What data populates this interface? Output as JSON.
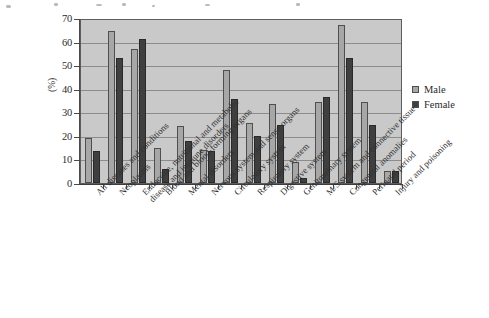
{
  "chart_data": {
    "type": "bar",
    "title": "",
    "xlabel": "",
    "ylabel": "(%)",
    "ylim": [
      0,
      70
    ],
    "yticks": [
      0,
      10,
      20,
      30,
      40,
      50,
      60,
      70
    ],
    "grid": true,
    "legend_position": "right",
    "categories": [
      "All diseases and conditions",
      "Neoplasms",
      "Endocrine, nutritional and metabolic disease and immune disorders",
      "Blood and blood-forming organs",
      "Mental disorders",
      "Nervous system and sense organs",
      "Circulatory system",
      "Respiratory system",
      "Digestive system",
      "Genitourinary system",
      "M/S system and connective tissue",
      "Congenital anomalies",
      "Perinatal period",
      "Injury and poisoning"
    ],
    "series": [
      {
        "name": "Male",
        "color": "#a7a7a7",
        "values": [
          19,
          64.5,
          57,
          15,
          24,
          14,
          48,
          25.5,
          33.5,
          9,
          34.5,
          67,
          34.5,
          5
        ]
      },
      {
        "name": "Female",
        "color": "#3f3f3f",
        "values": [
          13.5,
          53,
          61,
          6,
          18,
          13.5,
          35.5,
          20,
          24.5,
          2,
          36.5,
          53,
          24.5,
          5
        ]
      }
    ]
  },
  "legend": {
    "items": [
      {
        "label": "Male"
      },
      {
        "label": "Female"
      }
    ]
  },
  "axis": {
    "y_title": "(%)",
    "y_tick_labels": [
      "70",
      "60",
      "50",
      "40",
      "30",
      "20",
      "10",
      "0"
    ]
  }
}
